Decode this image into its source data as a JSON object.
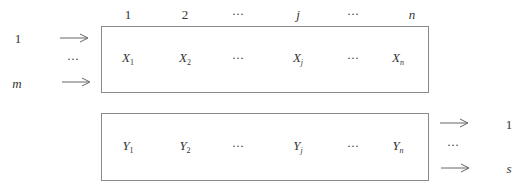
{
  "diagram": {
    "column_headers": [
      {
        "label": "1",
        "italic": false,
        "x": 128
      },
      {
        "label": "2",
        "italic": false,
        "x": 185
      },
      {
        "label": "···",
        "italic": false,
        "x": 237
      },
      {
        "label": "j",
        "italic": true,
        "x": 298
      },
      {
        "label": "···",
        "italic": false,
        "x": 352
      },
      {
        "label": "n",
        "italic": true,
        "x": 412
      }
    ],
    "inputs": {
      "labels": [
        {
          "label": "1",
          "italic": false
        },
        {
          "label": "···",
          "italic": false
        },
        {
          "label": "m",
          "italic": true
        }
      ]
    },
    "input_box": {
      "cells": [
        {
          "base": "X",
          "sub": "1"
        },
        {
          "base": "X",
          "sub": "2"
        },
        {
          "base": "···",
          "sub": ""
        },
        {
          "base": "X",
          "sub": "j"
        },
        {
          "base": "···",
          "sub": ""
        },
        {
          "base": "X",
          "sub": "n"
        }
      ]
    },
    "output_box": {
      "cells": [
        {
          "base": "Y",
          "sub": "1"
        },
        {
          "base": "Y",
          "sub": "2"
        },
        {
          "base": "···",
          "sub": ""
        },
        {
          "base": "Y",
          "sub": "j"
        },
        {
          "base": "···",
          "sub": ""
        },
        {
          "base": "Y",
          "sub": "n"
        }
      ]
    },
    "outputs": {
      "labels": [
        {
          "label": "1",
          "italic": false
        },
        {
          "label": "···",
          "italic": false
        },
        {
          "label": "s",
          "italic": true
        }
      ]
    },
    "colors": {
      "line": "#8a8a8a",
      "text": "#333333"
    }
  }
}
